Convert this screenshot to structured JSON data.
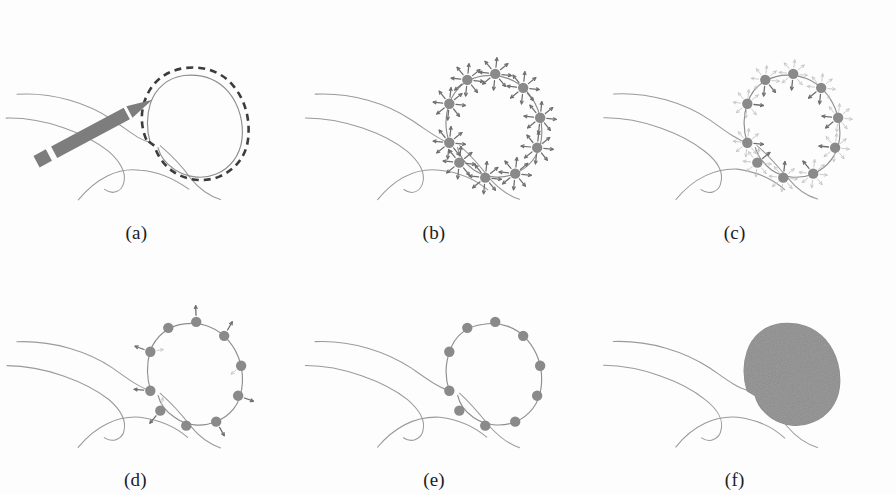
{
  "figure": {
    "caption_labels": [
      "(a)",
      "(b)",
      "(c)",
      "(d)",
      "(e)",
      "(f)"
    ],
    "panel_count": 6,
    "background_color": "#fdfdfd",
    "colors": {
      "anatomy_stroke": "#9a9a9a",
      "contour_stroke": "#8d8d8d",
      "node_fill": "#8a8a8a",
      "arrow_strong": "#6f6f6f",
      "arrow_faded": "#c3c3c3",
      "stylus_fill": "#7d7d7d",
      "region_fill": "#8e8e8e",
      "label_text": "#1c1c1c"
    }
  },
  "panels": [
    {
      "id": "a",
      "label": "(a)",
      "name": "initial-contour-drawn-by-user",
      "has_stylus": true,
      "has_dashed_contour": true,
      "has_solid_contour": true,
      "node_count": 0,
      "arrow_style": "none",
      "filled_region": false
    },
    {
      "id": "b",
      "label": "(b)",
      "name": "full-search-star-bursts",
      "has_stylus": false,
      "has_dashed_contour": false,
      "has_solid_contour": true,
      "node_count": 10,
      "arrow_style": "full-star",
      "rays_per_node": 8,
      "filled_region": false
    },
    {
      "id": "c",
      "label": "(c)",
      "name": "directional-search-narrowing",
      "has_stylus": false,
      "has_dashed_contour": false,
      "has_solid_contour": true,
      "node_count": 10,
      "arrow_style": "faded-star-with-dominant",
      "rays_per_node": 8,
      "filled_region": false
    },
    {
      "id": "d",
      "label": "(d)",
      "name": "few-residual-arrows",
      "has_stylus": false,
      "has_dashed_contour": false,
      "has_solid_contour": true,
      "node_count": 10,
      "arrow_style": "sparse-residual",
      "rays_per_node": 2,
      "filled_region": false
    },
    {
      "id": "e",
      "label": "(e)",
      "name": "converged-contour-nodes-only",
      "has_stylus": false,
      "has_dashed_contour": false,
      "has_solid_contour": true,
      "node_count": 10,
      "arrow_style": "none",
      "filled_region": false
    },
    {
      "id": "f",
      "label": "(f)",
      "name": "final-segmented-region-filled",
      "has_stylus": false,
      "has_dashed_contour": false,
      "has_solid_contour": false,
      "node_count": 0,
      "arrow_style": "none",
      "filled_region": true
    }
  ],
  "geometry": {
    "viewbox": "0 0 298 248",
    "anatomy_curves": [
      "M 16 94 C 52 92 88 104 112 120 C 128 131 139 140 150 143",
      "M 6 118 C 44 118 86 134 108 152 C 120 162 126 172 124 182 C 122 192 112 196 104 190",
      "M 78 200 C 96 178 118 168 140 170 C 160 172 176 180 188 190",
      "M 160 146 C 172 156 182 168 190 178 C 198 188 208 196 220 200"
    ],
    "contour_path": "M 150 143 C 146 130 146 116 150 104 C 155 88 168 78 184 76 C 202 74 218 80 228 92 C 240 106 244 124 242 140 C 240 156 230 168 216 174 C 202 180 186 178 174 170 C 166 164 160 156 158 148",
    "contour_path_closed": "M 150 143 C 146 130 146 116 150 104 C 155 88 168 78 184 76 C 202 74 218 80 228 92 C 240 106 244 124 242 140 C 240 156 230 168 216 174 C 202 180 186 178 174 170 C 166 164 160 156 158 148 Z",
    "dashed_contour_path": "M 146 140 C 140 126 140 110 146 97 C 153 80 168 70 186 68 C 206 66 223 73 234 87 C 246 102 250 121 248 139 C 246 157 235 170 219 177 C 204 183 186 181 173 172 C 164 166 157 156 154 146 Z",
    "stylus": {
      "tip": [
        152,
        100
      ],
      "tail": [
        36,
        162
      ],
      "width": 13
    },
    "nodes": [
      [
        150,
        104
      ],
      [
        168,
        80
      ],
      [
        196,
        74
      ],
      [
        224,
        88
      ],
      [
        241,
        118
      ],
      [
        238,
        148
      ],
      [
        216,
        174
      ],
      [
        186,
        178
      ],
      [
        160,
        163
      ],
      [
        150,
        143
      ]
    ],
    "node_radius": 5.2,
    "dominant_arrow_angles": [
      200,
      250,
      268,
      300,
      350,
      20,
      60,
      95,
      130,
      185
    ]
  }
}
